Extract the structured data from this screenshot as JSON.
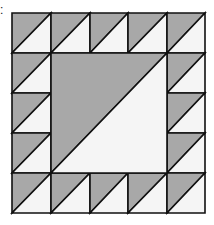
{
  "figure": {
    "corner_label": ":",
    "grid": {
      "cols": 5,
      "rows": 5
    },
    "xlines": [
      12,
      51,
      90,
      128,
      167,
      205
    ],
    "ylines": [
      13,
      53,
      93,
      133,
      173,
      213
    ],
    "colors": {
      "dark": "#a8a8a8",
      "light": "#f5f5f5",
      "line": "#111111"
    },
    "border_cells": "half-square triangles, dark upper-left, light lower-right, diagonal from bottom-left to top-right",
    "center_block": "single large half-square triangle spanning 3x3 cells, dark upper-left, light lower-right"
  }
}
